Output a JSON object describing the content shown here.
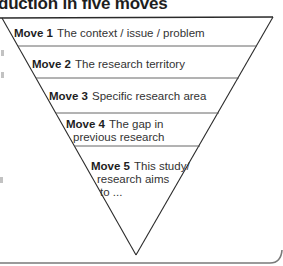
{
  "title": "duction in five moves",
  "diagram": {
    "type": "inverted-triangle",
    "stroke_color": "#2a2a2a",
    "divider_color": "#555555",
    "moves": [
      {
        "number": "Move 1",
        "lines": [
          "The context / issue / problem"
        ]
      },
      {
        "number": "Move 2",
        "lines": [
          "The research territory"
        ]
      },
      {
        "number": "Move 3",
        "lines": [
          "Specific research area"
        ]
      },
      {
        "number": "Move 4",
        "lines": [
          "The gap in",
          "previous research"
        ]
      },
      {
        "number": "Move 5",
        "lines": [
          "This study/",
          "research aims",
          "to ..."
        ]
      }
    ]
  }
}
